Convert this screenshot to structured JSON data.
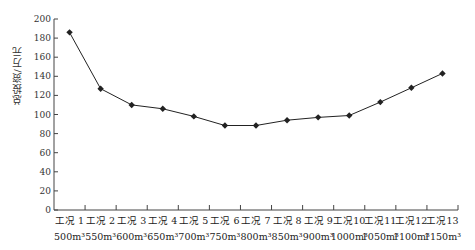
{
  "chart_data": {
    "type": "line",
    "title": "",
    "xlabel": "",
    "ylabel": "总投资/万元",
    "ylim": [
      0,
      200
    ],
    "yticks": [
      0,
      20,
      40,
      60,
      80,
      100,
      120,
      140,
      160,
      180,
      200
    ],
    "grid": false,
    "legend": null,
    "categories": [
      {
        "line1": "工况 1",
        "line2": "500m³"
      },
      {
        "line1": "工况 2",
        "line2": "550m³"
      },
      {
        "line1": "工况 3",
        "line2": "600m³"
      },
      {
        "line1": "工况 4",
        "line2": "650m³"
      },
      {
        "line1": "工况 5",
        "line2": "700m³"
      },
      {
        "line1": "工况 6",
        "line2": "750m³"
      },
      {
        "line1": "工况 7",
        "line2": "800m³"
      },
      {
        "line1": "工况 8",
        "line2": "850m³"
      },
      {
        "line1": "工况 9",
        "line2": "900m³"
      },
      {
        "line1": "工况10",
        "line2": "1000m³"
      },
      {
        "line1": "工况11",
        "line2": "1050m³"
      },
      {
        "line1": "工况12",
        "line2": "1100m³"
      },
      {
        "line1": "工况13",
        "line2": "1150m³"
      }
    ],
    "series": [
      {
        "name": "总投资",
        "marker": "diamond",
        "color": "#222222",
        "values": [
          186,
          127,
          110,
          106,
          98,
          88.5,
          88.5,
          94,
          97,
          99,
          113,
          128,
          143
        ]
      }
    ]
  }
}
